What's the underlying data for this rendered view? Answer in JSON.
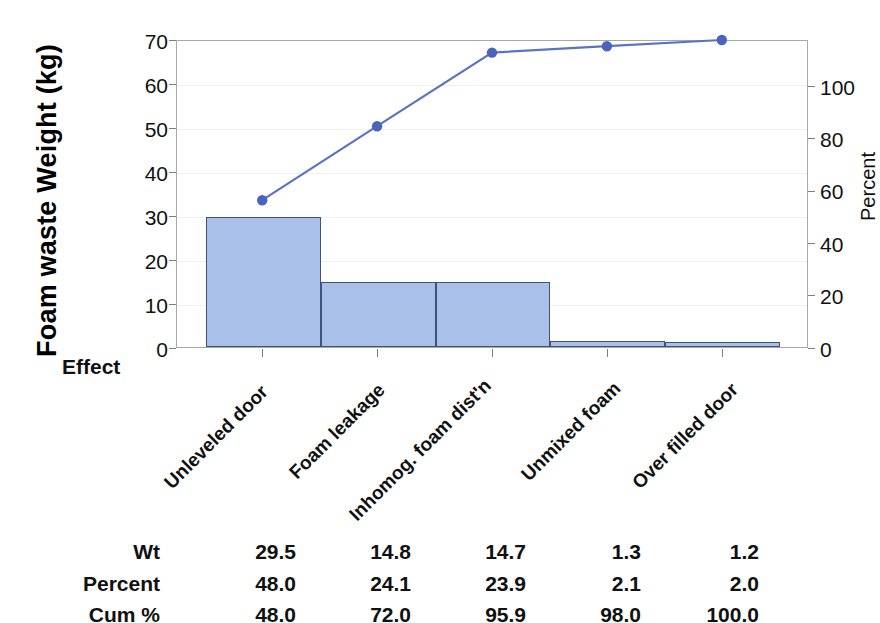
{
  "chart_data": {
    "type": "bar",
    "title": "",
    "subtitle": "",
    "categories": [
      "Unleveled door",
      "Foam leakage",
      "Inhomog. foam dist'n",
      "Unmixed foam",
      "Over filled door"
    ],
    "series": [
      {
        "name": "Wt",
        "type": "bar",
        "axis": "left",
        "values": [
          29.5,
          14.8,
          14.7,
          1.3,
          1.2
        ]
      },
      {
        "name": "Cum %",
        "type": "line",
        "axis": "right",
        "values": [
          48.0,
          72.0,
          95.9,
          98.0,
          100.0
        ]
      }
    ],
    "percent": [
      48.0,
      24.1,
      23.9,
      2.1,
      2.0
    ],
    "xlabel": "Effect",
    "ylabel": "Foam waste Weight (kg)",
    "ylabel_right": "Percent",
    "ylim": [
      0,
      70
    ],
    "ylim_right": [
      0,
      100
    ],
    "yticks": [
      0,
      10,
      20,
      30,
      40,
      50,
      60,
      70
    ],
    "yticks_right": [
      0,
      20,
      40,
      60,
      80,
      100
    ],
    "grid": true,
    "legend": "none",
    "colors": {
      "bar_fill": "#a9c0e8",
      "bar_stroke": "#42517a",
      "line": "#5a74c4",
      "marker": "#4a63bd",
      "axis": "#a9a9ad",
      "grid": "#efeff4",
      "text": "#111111"
    }
  },
  "axes": {
    "left_title": "Foam waste Weight (kg)",
    "right_title": "Percent",
    "x_axis_name": "Effect",
    "left_ticks": [
      "70",
      "60",
      "50",
      "40",
      "30",
      "20",
      "10",
      "0"
    ],
    "right_ticks": [
      "100",
      "80",
      "60",
      "40",
      "20",
      "0"
    ]
  },
  "category_labels": [
    "Unleveled door",
    "Foam leakage",
    "Inhomog. foam dist'n",
    "Unmixed foam",
    "Over filled door"
  ],
  "table": {
    "rows": [
      {
        "label": "Wt",
        "values": [
          "29.5",
          "14.8",
          "14.7",
          "1.3",
          "1.2"
        ]
      },
      {
        "label": "Percent",
        "values": [
          "48.0",
          "24.1",
          "23.9",
          "2.1",
          "2.0"
        ]
      },
      {
        "label": "Cum %",
        "values": [
          "48.0",
          "72.0",
          "95.9",
          "98.0",
          "100.0"
        ]
      }
    ]
  }
}
